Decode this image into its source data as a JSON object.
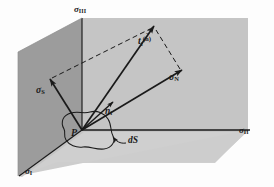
{
  "figure": {
    "background_color": "#fdfdfd",
    "line_color": "#1a1a1a",
    "plane_left_color": "#9a9a9a",
    "plane_right_color": "#c3c3c3",
    "plane_base_color": "#cfcfcf"
  },
  "labels": {
    "axis_sigma_3": {
      "symbol": "σ",
      "subscript": "III"
    },
    "axis_sigma_2": {
      "symbol": "σ",
      "subscript": "II"
    },
    "axis_sigma_1": {
      "symbol": "σ",
      "subscript": "I"
    },
    "normal_stress": {
      "symbol": "σ",
      "subscript": "N"
    },
    "shear_stress": {
      "symbol": "σ",
      "subscript": "S"
    },
    "normal_vector": {
      "symbol": "n",
      "subscript": "i"
    },
    "traction_vector": {
      "symbol": "t",
      "subscript": "i",
      "superscript": "n",
      "superscript_accent": "ˆ"
    },
    "point": {
      "symbol": "P"
    },
    "surface_element": {
      "symbol": "dS"
    }
  },
  "vectors": [
    {
      "name": "traction-vector",
      "label": "t_i^(n)",
      "style": "solid-arrow",
      "from": "P",
      "to": "traction-tip"
    },
    {
      "name": "normal-stress-vector",
      "label": "sigma_N",
      "style": "solid-arrow",
      "from": "P",
      "to": "normal-tip"
    },
    {
      "name": "shear-stress-vector",
      "label": "sigma_S",
      "style": "solid-arrow",
      "from": "P",
      "to": "shear-tip"
    },
    {
      "name": "unit-normal-vector",
      "label": "n_i",
      "style": "solid-arrow",
      "from": "P",
      "to": "normal-unit-tip"
    }
  ],
  "construction_lines": [
    {
      "name": "shear-to-traction-dashed",
      "style": "dashed",
      "from": "shear-tip",
      "to": "traction-tip"
    },
    {
      "name": "normal-to-traction-dashed",
      "style": "dashed",
      "from": "normal-tip",
      "to": "traction-tip"
    }
  ],
  "geometry": {
    "origin_P": {
      "x": 82,
      "y": 130
    },
    "traction_tip": {
      "x": 155,
      "y": 25
    },
    "normal_tip": {
      "x": 182,
      "y": 70
    },
    "shear_tip": {
      "x": 50,
      "y": 79
    },
    "normal_unit_tip": {
      "x": 112,
      "y": 103
    },
    "axis_sigma3_top": {
      "x": 82,
      "y": 18
    },
    "axis_sigma2_right": {
      "x": 248,
      "y": 130
    },
    "axis_sigma1_end": {
      "x": 20,
      "y": 176
    }
  }
}
